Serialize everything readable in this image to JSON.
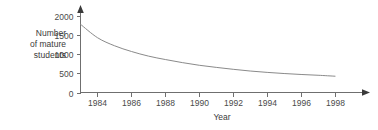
{
  "chart_data": {
    "type": "line",
    "title": "",
    "xlabel": "Year",
    "ylabel": "Number of mature students",
    "ylabel_lines": [
      "Number",
      "of mature",
      "students"
    ],
    "xlim": [
      1983,
      1999
    ],
    "ylim": [
      0,
      2100
    ],
    "grid": false,
    "legend": null,
    "y_ticks": [
      0,
      500,
      1000,
      1500,
      2000
    ],
    "y_tick_labels": [
      "0",
      "500",
      "1000",
      "1500",
      "2000"
    ],
    "x_ticks": [
      1984,
      1986,
      1988,
      1990,
      1992,
      1994,
      1996,
      1998
    ],
    "x_tick_labels": [
      "1984",
      "1986",
      "1988",
      "1990",
      "1992",
      "1994",
      "1996",
      "1998"
    ],
    "series": [
      {
        "name": "Number of mature students",
        "color": "#8a8a8a",
        "x": [
          1983,
          1984,
          1985,
          1986,
          1987,
          1988,
          1989,
          1990,
          1991,
          1992,
          1993,
          1994,
          1995,
          1996,
          1997,
          1998
        ],
        "values": [
          1780,
          1430,
          1220,
          1070,
          950,
          860,
          780,
          710,
          655,
          605,
          560,
          525,
          495,
          470,
          450,
          425
        ]
      }
    ],
    "axes_style": {
      "x_axis_arrow": true,
      "y_axis_arrow": true,
      "axis_color": "#6f6f6f",
      "tick_color": "#6f6f6f",
      "arrow_color": "#3a3a3a"
    }
  }
}
